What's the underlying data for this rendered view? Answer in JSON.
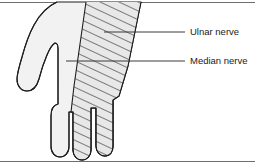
{
  "figure": {
    "type": "anatomical-diagram",
    "background_color": "#ffffff",
    "outline_color": "#1e1e1e",
    "palm_fill_color": "#f2f2f2",
    "hatch_fill_color": "#e8e8e8",
    "hatch_line_color": "#1e1e1e",
    "rule_color": "#6e6e6e",
    "label_color": "#1a1a1a"
  },
  "labels": [
    {
      "id": "ulnar",
      "text": "Ulnar nerve",
      "text_x": 190,
      "text_y": 32,
      "leader_from_x": 104,
      "leader_from_y": 32,
      "leader_to_x": 185,
      "leader_to_y": 32
    },
    {
      "id": "median",
      "text": "Median nerve",
      "text_x": 190,
      "text_y": 61,
      "leader_from_x": 66,
      "leader_from_y": 61,
      "leader_to_x": 185,
      "leader_to_y": 61
    }
  ],
  "rules": {
    "top_y": 2,
    "bottom_y": 161,
    "x_start": 0,
    "x_end": 255
  }
}
